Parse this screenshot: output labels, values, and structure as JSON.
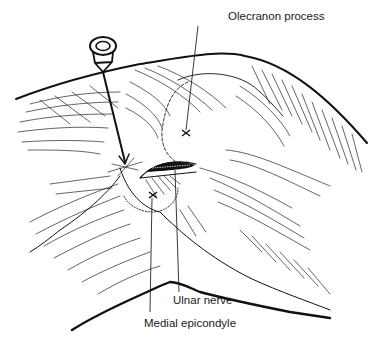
{
  "figure": {
    "labels": {
      "olecranon_process": "Olecranon process",
      "ulnar_nerve": "Ulnar nerve",
      "medial_epicondyle": "Medial epicondyle"
    },
    "markers": [
      {
        "name": "olecranon-process-marker",
        "symbol": "×",
        "x": 186,
        "y": 133
      },
      {
        "name": "medial-epicondyle-marker",
        "symbol": "×",
        "x": 153,
        "y": 195
      }
    ],
    "colors": {
      "ink": "#111111",
      "background": "#ffffff"
    }
  }
}
